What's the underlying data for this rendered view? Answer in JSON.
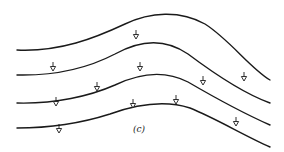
{
  "figure": {
    "label": "(c)",
    "stroke_color": "#1a1a1a",
    "background": "#ffffff",
    "curves": [
      {
        "id": "curve-1",
        "d": "M17,50 C60,52 95,38 125,24 C150,12 180,10 205,24 C230,40 250,68 270,80"
      },
      {
        "id": "curve-2",
        "d": "M17,75 C60,76 92,66 115,54 C140,40 165,38 188,54 C212,72 245,94 270,103"
      },
      {
        "id": "curve-3",
        "d": "M17,103 C55,104 90,96 115,85 C140,73 165,70 188,82 C212,96 245,114 270,125"
      },
      {
        "id": "curve-4",
        "d": "M17,128 C55,128 85,122 110,114 C135,105 165,100 190,108 C215,118 245,136 270,147"
      }
    ],
    "arrows": [
      {
        "x": 136,
        "y": 30
      },
      {
        "x": 53,
        "y": 62
      },
      {
        "x": 140,
        "y": 62
      },
      {
        "x": 97,
        "y": 82
      },
      {
        "x": 203,
        "y": 76
      },
      {
        "x": 244,
        "y": 72
      },
      {
        "x": 56,
        "y": 97
      },
      {
        "x": 133,
        "y": 99
      },
      {
        "x": 176,
        "y": 95
      },
      {
        "x": 59,
        "y": 124
      },
      {
        "x": 236,
        "y": 117
      }
    ]
  }
}
